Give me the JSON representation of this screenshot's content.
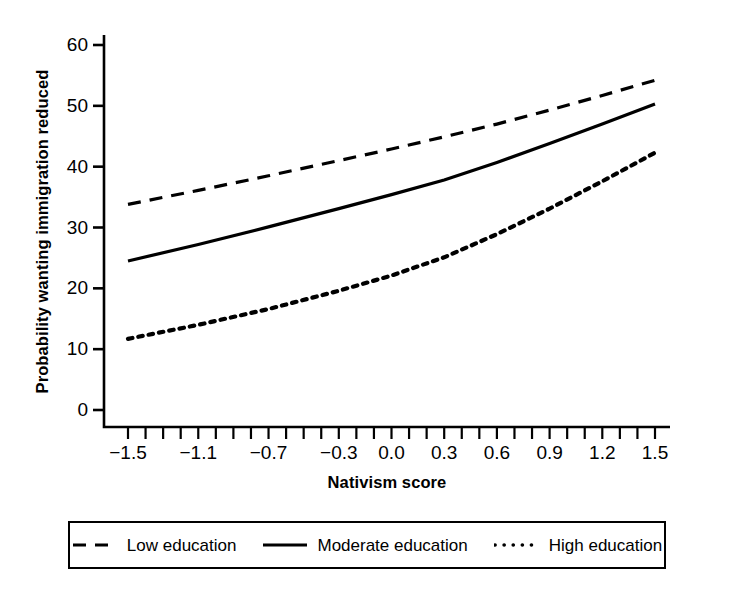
{
  "chart_data": {
    "type": "line",
    "title": "",
    "xlabel": "Nativism score",
    "ylabel": "Probability wanting immigration reduced",
    "xlim": [
      -1.5,
      1.5
    ],
    "ylim": [
      0,
      62
    ],
    "grid": false,
    "legend_position": "bottom",
    "x_major_ticks": [
      -1.5,
      -1.2,
      -0.9,
      -0.6,
      -0.3,
      0.0,
      0.3,
      0.6,
      0.9,
      1.2,
      1.5
    ],
    "x_major_tick_labels": [
      "-1.5",
      "-1.1",
      "-0.7",
      "-0.3",
      "0.0",
      "0.3",
      "0.6",
      "0.9",
      "1.2",
      "1.5"
    ],
    "x_labeled_positions": [
      -1.5,
      -1.1,
      -0.7,
      -0.3,
      0.0,
      0.3,
      0.6,
      0.9,
      1.2,
      1.5
    ],
    "x_minor_tick_step": 0.1,
    "y_ticks": [
      0,
      10,
      20,
      30,
      40,
      50,
      60
    ],
    "y_tick_labels": [
      "0",
      "10",
      "20",
      "30",
      "40",
      "50",
      "60"
    ],
    "x": [
      -1.5,
      -1.1,
      -0.7,
      -0.3,
      0.0,
      0.3,
      0.6,
      0.9,
      1.2,
      1.5
    ],
    "series": [
      {
        "name": "Low education",
        "style": "dashed",
        "color": "#000000",
        "values": [
          33.8,
          36.1,
          38.5,
          41.0,
          42.9,
          44.9,
          47.0,
          49.3,
          51.7,
          54.2
        ]
      },
      {
        "name": "Moderate education",
        "style": "solid",
        "color": "#000000",
        "values": [
          24.5,
          27.2,
          30.1,
          33.1,
          35.4,
          37.8,
          40.7,
          43.8,
          47.0,
          50.3
        ]
      },
      {
        "name": "High education",
        "style": "dotted",
        "color": "#000000",
        "values": [
          11.7,
          14.0,
          16.6,
          19.6,
          22.1,
          25.1,
          28.9,
          33.1,
          37.6,
          42.3
        ]
      }
    ]
  },
  "legend": {
    "entries": [
      {
        "label": "Low education",
        "style": "dashed"
      },
      {
        "label": "Moderate education",
        "style": "solid"
      },
      {
        "label": "High education",
        "style": "dotted"
      }
    ]
  },
  "axes": {
    "y_title": "Probability wanting immigration reduced",
    "x_title": "Nativism score"
  }
}
